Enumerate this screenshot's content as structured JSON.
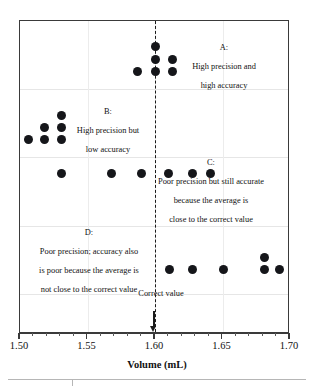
{
  "chart_data": {
    "type": "scatter",
    "title": "",
    "xlabel": "Volume (mL)",
    "ylabel": "",
    "xlim": [
      1.5,
      1.7
    ],
    "xticks": [
      1.5,
      1.55,
      1.6,
      1.65,
      1.7
    ],
    "xticklabels": [
      "1.50",
      "1.55",
      "1.60",
      "1.65",
      "1.70"
    ],
    "minor_tick_step": 0.01,
    "grid": true,
    "legend": "none",
    "reference_line": {
      "label": "Correct\nvalue",
      "label_line1": "Correct",
      "label_line2": "value",
      "x": 1.6,
      "style": "dashed"
    },
    "series": [
      {
        "name": "A",
        "annotation": "A:\nHigh precision and\nhigh accuracy",
        "annotation_lines": [
          "A:",
          "High precision and",
          "high accuracy"
        ],
        "band": 1,
        "points": [
          {
            "x": 1.6,
            "row": 0
          },
          {
            "x": 1.6,
            "row": 1
          },
          {
            "x": 1.613,
            "row": 1
          },
          {
            "x": 1.587,
            "row": 2
          },
          {
            "x": 1.6,
            "row": 2
          },
          {
            "x": 1.613,
            "row": 2
          }
        ]
      },
      {
        "name": "B",
        "annotation": "B:\nHigh precision but\nlow accuracy",
        "annotation_lines": [
          "B:",
          "High precision but",
          "low accuracy"
        ],
        "band": 2,
        "points": [
          {
            "x": 1.531,
            "row": 0
          },
          {
            "x": 1.531,
            "row": 1
          },
          {
            "x": 1.518,
            "row": 1
          },
          {
            "x": 1.531,
            "row": 2
          },
          {
            "x": 1.518,
            "row": 2
          },
          {
            "x": 1.506,
            "row": 2
          }
        ]
      },
      {
        "name": "C",
        "annotation": "C:\nPoor precision but still accurate\nbecause the average is\nclose to the correct value",
        "annotation_lines": [
          "C:",
          "Poor precision but still accurate",
          "because the average is",
          "close to the correct value"
        ],
        "band": 3,
        "points": [
          {
            "x": 1.531,
            "row": 0
          },
          {
            "x": 1.568,
            "row": 0
          },
          {
            "x": 1.59,
            "row": 0
          },
          {
            "x": 1.61,
            "row": 0
          },
          {
            "x": 1.628,
            "row": 0
          },
          {
            "x": 1.641,
            "row": 0
          }
        ]
      },
      {
        "name": "D",
        "annotation": "D:\nPoor precision; accuracy also\nis poor because the average is\nnot close to the correct value",
        "annotation_lines": [
          "D:",
          "Poor precision; accuracy also",
          "is poor because the average is",
          "not close to the correct value"
        ],
        "band": 4,
        "points": [
          {
            "x": 1.611,
            "row": 1
          },
          {
            "x": 1.628,
            "row": 1
          },
          {
            "x": 1.651,
            "row": 1
          },
          {
            "x": 1.681,
            "row": 0
          },
          {
            "x": 1.681,
            "row": 1
          },
          {
            "x": 1.692,
            "row": 1
          }
        ]
      }
    ]
  },
  "axis": {
    "x_title": "Volume (mL)",
    "tick_labels": [
      "1.50",
      "1.55",
      "1.60",
      "1.65",
      "1.70"
    ]
  },
  "annotations": {
    "group_a": {
      "line1": "A:",
      "line2": "High precision and",
      "line3": "high accuracy"
    },
    "group_b": {
      "line1": "B:",
      "line2": "High precision but",
      "line3": "low accuracy"
    },
    "group_c": {
      "line1": "C:",
      "line2": "Poor precision but still accurate",
      "line3": "because the average is",
      "line4": "close to the correct value"
    },
    "group_d": {
      "line1": "D:",
      "line2": "Poor precision; accuracy also",
      "line3": "is poor because the average is",
      "line4": "not close to the correct value"
    },
    "correct_value": {
      "line1": "Correct",
      "line2": "value"
    }
  },
  "colors": {
    "dot": "#15161a",
    "frame": "#3a3a3a",
    "grid": "#e6e6e6",
    "reference": "#1a1a1a",
    "text": "#111111",
    "footer_rule": "#b6b6b6"
  }
}
